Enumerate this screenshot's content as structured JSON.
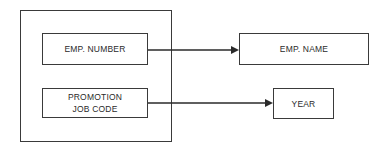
{
  "diagram": {
    "type": "functional-dependency",
    "composite_key": {
      "attributes": [
        {
          "id": "emp-number",
          "label": "EMP. NUMBER"
        },
        {
          "id": "promotion-job-code",
          "label": "PROMOTION\nJOB CODE"
        }
      ]
    },
    "targets": [
      {
        "id": "emp-name",
        "label": "EMP. NAME"
      },
      {
        "id": "year",
        "label": "YEAR"
      }
    ],
    "edges": [
      {
        "from": "emp-number",
        "to": "emp-name"
      },
      {
        "from": "promotion-job-code",
        "to": "year"
      }
    ],
    "colors": {
      "line": "#2a2a2a",
      "background": "#ffffff"
    }
  }
}
